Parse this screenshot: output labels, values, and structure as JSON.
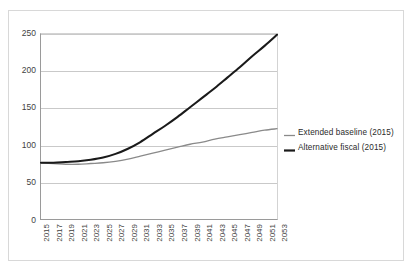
{
  "chart_data": {
    "type": "line",
    "title": "",
    "xlabel": "",
    "ylabel": "",
    "xlim": [
      2015,
      2053
    ],
    "ylim": [
      0,
      250
    ],
    "grid": true,
    "legend_position": "right",
    "y_ticks": [
      250,
      200,
      150,
      100,
      50,
      0
    ],
    "x": [
      2015,
      2017,
      2019,
      2021,
      2023,
      2025,
      2027,
      2029,
      2031,
      2033,
      2035,
      2037,
      2039,
      2041,
      2043,
      2045,
      2047,
      2049,
      2051,
      2053
    ],
    "categories": [
      "2015",
      "2017",
      "2019",
      "2021",
      "2023",
      "2025",
      "2027",
      "2029",
      "2031",
      "2033",
      "2035",
      "2037",
      "2039",
      "2041",
      "2043",
      "2045",
      "2047",
      "2049",
      "2051",
      "2053"
    ],
    "series": [
      {
        "name": "Extended baseline (2015)",
        "color": "#8a8a8a",
        "width": 1.3,
        "values": [
          76,
          75,
          74,
          74,
          75,
          76,
          78,
          81,
          85,
          89,
          93,
          97,
          101,
          104,
          108,
          111,
          114,
          117,
          120,
          122
        ]
      },
      {
        "name": "Alternative fiscal (2015)",
        "color": "#1a1a1a",
        "width": 2.1,
        "values": [
          76,
          76,
          77,
          78,
          80,
          83,
          88,
          95,
          104,
          115,
          126,
          138,
          151,
          164,
          177,
          191,
          205,
          220,
          234,
          249
        ]
      }
    ]
  },
  "legend": {
    "items": [
      {
        "label": "Extended baseline (2015)",
        "color": "#8a8a8a",
        "thickness": "1.3px"
      },
      {
        "label": "Alternative fiscal (2015)",
        "color": "#1a1a1a",
        "thickness": "2.2px"
      }
    ]
  },
  "colors": {
    "background": "#ffffff",
    "frame_border": "#d8d8d8",
    "axis": "#9a9a9a",
    "gridline": "#c9c9c9",
    "tick_text": "#3f3f3f"
  }
}
